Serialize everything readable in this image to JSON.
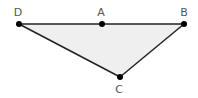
{
  "diagram": {
    "type": "geometry-triangle",
    "fill_color": "#efefef",
    "stroke_color": "#222222",
    "point_color": "#000000",
    "label_color": "#555555",
    "points": [
      {
        "label": "D",
        "x": 19,
        "y": 24,
        "label_x": 18,
        "label_y": 16
      },
      {
        "label": "A",
        "x": 102,
        "y": 24,
        "label_x": 101,
        "label_y": 16
      },
      {
        "label": "B",
        "x": 184,
        "y": 24,
        "label_x": 184,
        "label_y": 16
      },
      {
        "label": "C",
        "x": 120,
        "y": 77,
        "label_x": 119,
        "label_y": 93
      }
    ],
    "polygon": [
      "D",
      "B",
      "C"
    ],
    "segments": [
      [
        "D",
        "B"
      ],
      [
        "B",
        "C"
      ],
      [
        "C",
        "D"
      ]
    ]
  }
}
